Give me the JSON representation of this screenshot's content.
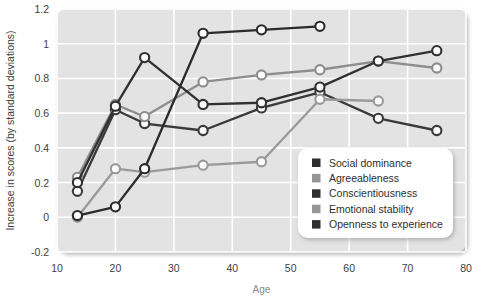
{
  "chart_data": {
    "type": "line",
    "title": "",
    "xlabel": "Age",
    "ylabel": "Increase in scores (by standard deviations)",
    "xlim": [
      10,
      80
    ],
    "ylim": [
      -0.2,
      1.2
    ],
    "xticks": [
      10,
      20,
      30,
      40,
      50,
      60,
      70,
      80
    ],
    "yticks": [
      -0.2,
      0,
      0.2,
      0.4,
      0.6,
      0.8,
      1,
      1.2
    ],
    "xtick_labels": [
      "10",
      "20",
      "30",
      "40",
      "50",
      "60",
      "70",
      "80"
    ],
    "ytick_labels": [
      "-0.2",
      "0",
      "0.2",
      "0.4",
      "0.6",
      "0.8",
      "1",
      "1.2"
    ],
    "grid": true,
    "legend_position": "bottom-right",
    "plot_background": "#e3e3e3",
    "grid_color": "#ffffff",
    "marker": "open-circle",
    "series": [
      {
        "name": "Social dominance",
        "color": "#3a3a3a",
        "x": [
          13.5,
          20,
          25,
          35,
          45,
          55,
          65,
          75
        ],
        "y": [
          0.15,
          0.62,
          0.54,
          0.5,
          0.63,
          0.72,
          0.57,
          0.5
        ]
      },
      {
        "name": "Agreeableness",
        "color": "#8d8d8d",
        "x": [
          13.5,
          20,
          25,
          35,
          45,
          55,
          65,
          75
        ],
        "y": [
          0.23,
          0.65,
          0.58,
          0.78,
          0.82,
          0.85,
          0.9,
          0.86
        ]
      },
      {
        "name": "Conscientiousness",
        "color": "#303030",
        "x": [
          13.5,
          20,
          25,
          35,
          45,
          55,
          65,
          75
        ],
        "y": [
          0.2,
          0.64,
          0.92,
          0.65,
          0.66,
          0.75,
          0.9,
          0.96
        ]
      },
      {
        "name": "Emotional stability",
        "color": "#9a9a9a",
        "x": [
          13.5,
          20,
          25,
          35,
          45,
          55,
          65
        ],
        "y": [
          0.0,
          0.28,
          0.26,
          0.3,
          0.32,
          0.68,
          0.67
        ]
      },
      {
        "name": "Openness to experience",
        "color": "#2b2b2b",
        "x": [
          13.5,
          20,
          25,
          35,
          45,
          55
        ],
        "y": [
          0.01,
          0.06,
          0.28,
          0.5,
          0.66,
          1.1
        ]
      }
    ],
    "top_series_override": {
      "name": "Openness to experience",
      "note": "",
      "x": [
        13.5,
        20,
        25,
        35,
        45,
        55
      ],
      "y": [
        0.01,
        0.06,
        0.28,
        1.06,
        1.08,
        1.1
      ]
    }
  },
  "legend": {
    "items": [
      {
        "label": "Social dominance",
        "swatch": "#2e2e2e"
      },
      {
        "label": "Agreeableness",
        "swatch": "#969696"
      },
      {
        "label": "Conscientiousness",
        "swatch": "#2e2e2e"
      },
      {
        "label": "Emotional stability",
        "swatch": "#969696"
      },
      {
        "label": "Openness to experience",
        "swatch": "#2e2e2e"
      }
    ]
  }
}
